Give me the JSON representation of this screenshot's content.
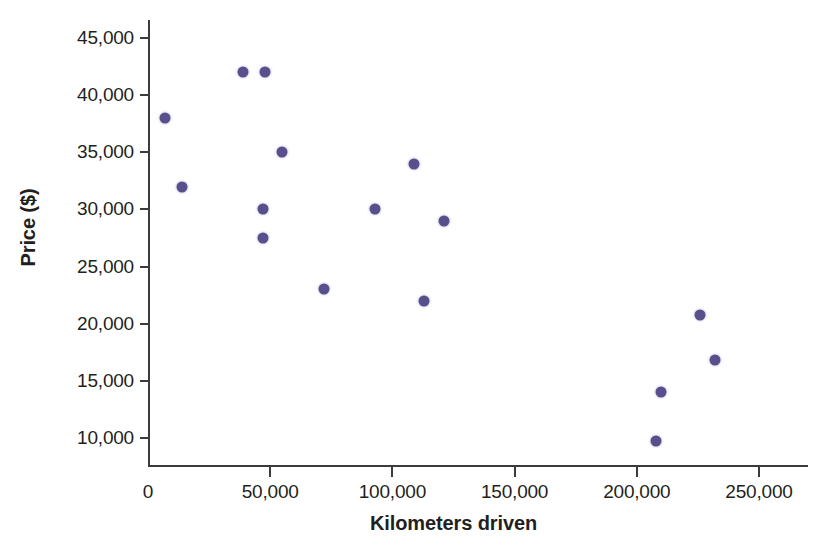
{
  "chart_data": {
    "type": "scatter",
    "title": "",
    "xlabel": "Kilometers driven",
    "ylabel": "Price ($)",
    "xlim": [
      0,
      265000
    ],
    "ylim": [
      7000,
      46500
    ],
    "grid": false,
    "legend": null,
    "marker_color": "#57508c",
    "axis_color": "#3b3b3d",
    "xticks": [
      0,
      50000,
      100000,
      150000,
      200000,
      250000
    ],
    "xticklabels": [
      "0",
      "50,000",
      "100,000",
      "150,000",
      "200,000",
      "250,000"
    ],
    "yticks": [
      10000,
      15000,
      20000,
      25000,
      30000,
      35000,
      40000,
      45000
    ],
    "yticklabels": [
      "10,000",
      "15,000",
      "20,000",
      "25,000",
      "30,000",
      "35,000",
      "40,000",
      "45,000"
    ],
    "points": [
      {
        "x": 7000,
        "y": 38000
      },
      {
        "x": 14000,
        "y": 32000
      },
      {
        "x": 39000,
        "y": 42000
      },
      {
        "x": 48000,
        "y": 42000
      },
      {
        "x": 47000,
        "y": 30000
      },
      {
        "x": 47000,
        "y": 27500
      },
      {
        "x": 55000,
        "y": 35000
      },
      {
        "x": 72000,
        "y": 23000
      },
      {
        "x": 93000,
        "y": 30000
      },
      {
        "x": 109000,
        "y": 34000
      },
      {
        "x": 113000,
        "y": 22000
      },
      {
        "x": 121000,
        "y": 29000
      },
      {
        "x": 208000,
        "y": 9700
      },
      {
        "x": 210000,
        "y": 14000
      },
      {
        "x": 226000,
        "y": 20800
      },
      {
        "x": 232000,
        "y": 16800
      }
    ]
  }
}
